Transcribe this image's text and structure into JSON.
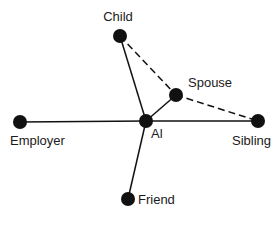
{
  "diagram": {
    "type": "social-network",
    "ink_color": "#111111",
    "background": "#ffffff",
    "nodes": [
      {
        "id": "child",
        "label": "Child",
        "x": 120,
        "y": 36,
        "lx": 118,
        "ly": 21,
        "anchor": "middle"
      },
      {
        "id": "spouse",
        "label": "Spouse",
        "x": 176,
        "y": 95,
        "lx": 188,
        "ly": 87,
        "anchor": "start"
      },
      {
        "id": "employer",
        "label": "Employer",
        "x": 20,
        "y": 122,
        "lx": 10,
        "ly": 145,
        "anchor": "start"
      },
      {
        "id": "al",
        "label": "Al",
        "x": 146,
        "y": 121,
        "lx": 151,
        "ly": 138,
        "anchor": "start"
      },
      {
        "id": "sibling",
        "label": "Sibling",
        "x": 258,
        "y": 121,
        "lx": 232,
        "ly": 145,
        "anchor": "start"
      },
      {
        "id": "friend",
        "label": "Friend",
        "x": 128,
        "y": 199,
        "lx": 138,
        "ly": 204,
        "anchor": "start"
      }
    ],
    "edges": [
      {
        "from": "al",
        "to": "employer",
        "style": "solid"
      },
      {
        "from": "al",
        "to": "sibling",
        "style": "solid"
      },
      {
        "from": "al",
        "to": "child",
        "style": "solid"
      },
      {
        "from": "al",
        "to": "spouse",
        "style": "solid"
      },
      {
        "from": "al",
        "to": "friend",
        "style": "solid"
      },
      {
        "from": "child",
        "to": "spouse",
        "style": "dashed"
      },
      {
        "from": "spouse",
        "to": "sibling",
        "style": "dashed"
      }
    ]
  }
}
